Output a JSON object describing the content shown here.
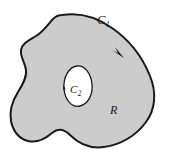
{
  "figure": {
    "background_color": "#ffffff",
    "region_fill_color": "#cccccc",
    "curve_color": "#1a1a1a",
    "label_color": "#1a1a1a",
    "outer_curve_stroke_width": 2.0,
    "inner_curve_stroke_width": 1.3,
    "labels": {
      "outer_curve": "C",
      "outer_curve_subscript": "1",
      "inner_curve": "C",
      "inner_curve_subscript": "2",
      "region": "R"
    },
    "orientation_markers": [
      {
        "name": "outer-curve-direction-arrow",
        "x": 120,
        "y": 53,
        "direction": "down-right"
      },
      {
        "name": "inner-curve-direction-arrow",
        "x": 65,
        "y": 86,
        "direction": "up"
      }
    ]
  }
}
